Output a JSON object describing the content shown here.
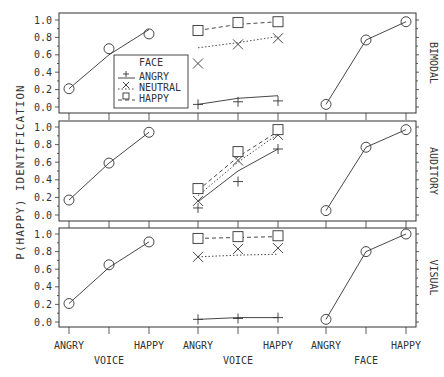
{
  "chart_data": {
    "type": "line",
    "title": "",
    "ylabel": "P(HAPPY) IDENTIFICATION",
    "ylim": [
      0,
      1
    ],
    "yticks": [
      "0.0",
      "0.2",
      "0.4",
      "0.6",
      "0.8",
      "1.0"
    ],
    "grid": false,
    "groups": [
      {
        "xlabel": "VOICE",
        "categories": [
          "ANGRY",
          "",
          "HAPPY"
        ]
      },
      {
        "xlabel": "VOICE",
        "categories": [
          "ANGRY",
          "",
          "HAPPY"
        ]
      },
      {
        "xlabel": "FACE",
        "categories": [
          "ANGRY",
          "",
          "HAPPY"
        ]
      }
    ],
    "legend": {
      "title": "FACE",
      "entries": [
        {
          "label": "ANGRY",
          "marker": "plus",
          "line": "solid"
        },
        {
          "label": "NEUTRAL",
          "marker": "x",
          "line": "dotted"
        },
        {
          "label": "HAPPY",
          "marker": "square",
          "line": "dashed"
        }
      ],
      "position": "inside upper-left panel (BIMODAL), center-left"
    },
    "panels": [
      {
        "name": "BIMODAL",
        "voice_only": {
          "marker": "circle",
          "values": [
            0.21,
            0.67,
            0.84
          ],
          "fit": [
            0.21,
            0.6,
            0.89
          ]
        },
        "bimodal": [
          {
            "face": "ANGRY",
            "marker": "plus",
            "values": [
              0.03,
              0.06,
              0.07
            ],
            "fit": [
              0.03,
              0.1,
              0.13
            ]
          },
          {
            "face": "NEUTRAL",
            "marker": "x",
            "values": [
              0.5,
              0.72,
              0.79
            ],
            "fit": [
              0.68,
              0.74,
              0.81
            ]
          },
          {
            "face": "HAPPY",
            "marker": "square",
            "values": [
              0.88,
              0.97,
              0.98
            ],
            "fit": [
              0.88,
              0.95,
              0.98
            ]
          }
        ],
        "face_only": {
          "marker": "circle",
          "values": [
            0.03,
            0.77,
            0.98
          ],
          "fit": [
            0.03,
            0.77,
            0.98
          ]
        }
      },
      {
        "name": "AUDITORY",
        "voice_only": {
          "marker": "circle",
          "values": [
            0.17,
            0.59,
            0.94
          ],
          "fit": [
            0.17,
            0.59,
            0.94
          ]
        },
        "bimodal": [
          {
            "face": "ANGRY",
            "marker": "plus",
            "values": [
              0.08,
              0.38,
              0.75
            ],
            "fit": [
              0.15,
              0.5,
              0.75
            ]
          },
          {
            "face": "NEUTRAL",
            "marker": "x",
            "values": [
              0.16,
              0.62,
              0.91
            ],
            "fit": [
              0.22,
              0.6,
              0.92
            ]
          },
          {
            "face": "HAPPY",
            "marker": "square",
            "values": [
              0.3,
              0.72,
              0.97
            ],
            "fit": [
              0.28,
              0.66,
              0.95
            ]
          }
        ],
        "face_only": {
          "marker": "circle",
          "values": [
            0.05,
            0.77,
            0.97
          ],
          "fit": [
            0.05,
            0.77,
            0.97
          ]
        }
      },
      {
        "name": "VISUAL",
        "voice_only": {
          "marker": "circle",
          "values": [
            0.21,
            0.65,
            0.91
          ],
          "fit": [
            0.21,
            0.62,
            0.91
          ]
        },
        "bimodal": [
          {
            "face": "ANGRY",
            "marker": "plus",
            "values": [
              0.03,
              0.04,
              0.05
            ],
            "fit": [
              0.03,
              0.05,
              0.05
            ]
          },
          {
            "face": "NEUTRAL",
            "marker": "x",
            "values": [
              0.74,
              0.83,
              0.84
            ],
            "fit": [
              0.74,
              0.76,
              0.77
            ]
          },
          {
            "face": "HAPPY",
            "marker": "square",
            "values": [
              0.95,
              0.97,
              0.98
            ],
            "fit": [
              0.95,
              0.96,
              0.97
            ]
          }
        ],
        "face_only": {
          "marker": "circle",
          "values": [
            0.03,
            0.8,
            1.0
          ],
          "fit": [
            0.03,
            0.8,
            1.0
          ]
        }
      }
    ]
  },
  "colors": {
    "ink": "#333333",
    "background": "#ffffff"
  }
}
